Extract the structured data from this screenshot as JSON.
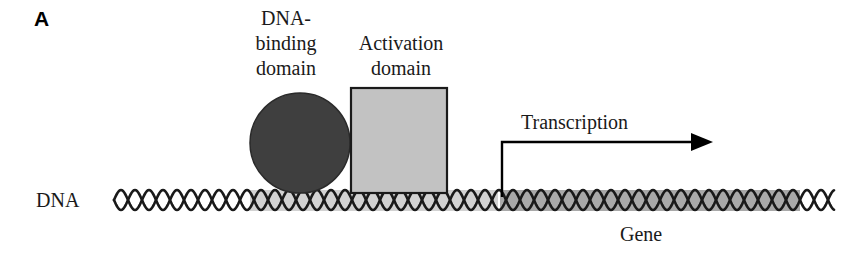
{
  "figure": {
    "panel_label": "A",
    "background_color": "#ffffff"
  },
  "labels": {
    "dna_binding_domain": "DNA-\nbinding\ndomain",
    "activation_domain": "Activation\ndomain",
    "dna": "DNA",
    "transcription": "Transcription",
    "gene": "Gene"
  },
  "shapes": {
    "dna_binding_domain_circle": {
      "name": "DNA-binding domain",
      "shape": "circle",
      "fill_color": "#3f3f3f",
      "stroke_color": "#2a2a2a",
      "cx": 300,
      "cy": 143,
      "r": 50
    },
    "activation_domain_square": {
      "name": "Activation domain",
      "shape": "rectangle",
      "fill_color": "#c2c2c2",
      "stroke_color": "#1a1a1a",
      "x": 351,
      "y": 88,
      "width": 96,
      "height": 105
    },
    "dna_strand": {
      "name": "DNA double helix",
      "stroke_color": "#1a1a1a",
      "x_start": 114,
      "x_end": 834,
      "center_y": 200,
      "amplitude": 10,
      "period": 28
    },
    "protein_band": {
      "name": "promoter region shading",
      "fill_color": "#d2d2d2",
      "x": 250,
      "y": 190,
      "width": 248,
      "height": 21
    },
    "gene_band": {
      "name": "gene region shading",
      "fill_color": "#a9a9a9",
      "x": 500,
      "y": 190,
      "width": 300,
      "height": 21
    },
    "transcription_arrow": {
      "name": "transcription direction arrow",
      "stroke_color": "#000000",
      "origin_x": 502,
      "origin_y": 197,
      "corner_y": 142,
      "tip_x": 713
    }
  }
}
